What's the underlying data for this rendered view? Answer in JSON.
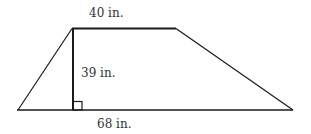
{
  "figure": {
    "shape": "trapezoid",
    "top_base_label": "40 in.",
    "height_label": "39 in.",
    "bottom_base_label": "68 in.",
    "right_angle_marker": true,
    "stroke_color": "#1a1a1a"
  }
}
